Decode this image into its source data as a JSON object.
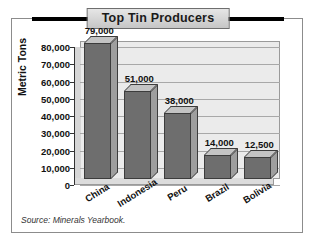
{
  "chart_data": {
    "type": "bar",
    "title": "Top Tin Producers",
    "xlabel": "",
    "ylabel": "Metric Tons",
    "categories": [
      "China",
      "Indonesia",
      "Peru",
      "Brazil",
      "Bolivia"
    ],
    "values": [
      79000,
      51000,
      38000,
      14000,
      12500
    ],
    "value_labels": [
      "79,000",
      "51,000",
      "38,000",
      "14,000",
      "12,500"
    ],
    "ylim": [
      0,
      80000
    ],
    "ytick_labels": [
      "80,000",
      "70,000",
      "60,000",
      "50,000",
      "40,000",
      "30,000",
      "20,000",
      "10,000",
      "0"
    ],
    "ytick_values": [
      80000,
      70000,
      60000,
      50000,
      40000,
      30000,
      20000,
      10000,
      0
    ],
    "grid": true,
    "legend": false,
    "style": "3d-column",
    "colors": {
      "bar_front": "#6e6e6e",
      "bar_top": "#c4c4c4",
      "bar_side": "#9e9e9e",
      "plot_background": "#ebebeb",
      "gridline": "#a8a8a8",
      "title_band": "#000000",
      "border": "#8c8c8c"
    }
  },
  "source": {
    "note": "Source: Minerals Yearbook."
  }
}
